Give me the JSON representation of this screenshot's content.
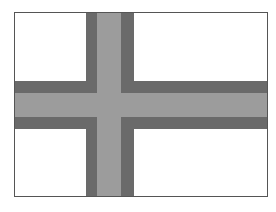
{
  "flag": {
    "description": "Nordic cross flag rendered in grayscale",
    "colors": {
      "field": "#ffffff",
      "border": "#555555",
      "cross_outer": "#6a6a6a",
      "cross_inner": "#9c9c9c"
    }
  }
}
